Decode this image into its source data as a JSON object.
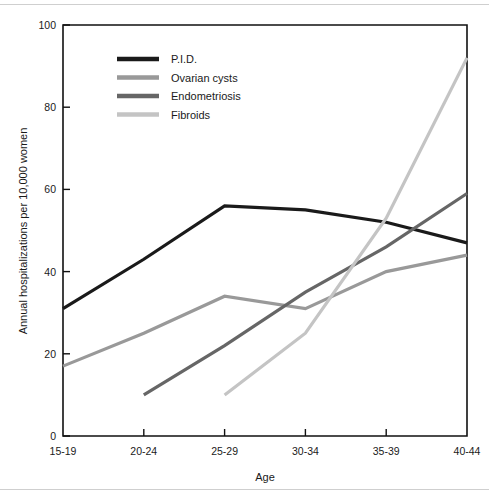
{
  "figure": {
    "background": "#ffffff",
    "rule_color": "#cfcfcf"
  },
  "chart_data": {
    "type": "line",
    "title": "",
    "subtitle": "",
    "xlabel": "Age",
    "ylabel": "Annual hospitalizations per 10,000 women",
    "categories": [
      "15-19",
      "20-24",
      "25-29",
      "30-34",
      "35-39",
      "40-44"
    ],
    "xticklabels": [
      "15-19",
      "20-24",
      "25-29",
      "30-34",
      "35-39",
      "40-44"
    ],
    "yticklabels": [
      "0",
      "20",
      "40",
      "60",
      "80",
      "100"
    ],
    "yticks": [
      0,
      20,
      40,
      60,
      80,
      100
    ],
    "ylim": [
      0,
      100
    ],
    "grid": false,
    "legend_position": "upper-left-inside",
    "series": [
      {
        "name": "P.I.D.",
        "color": "#1a1a1a",
        "width": 3.2,
        "values": [
          31,
          43,
          56,
          55,
          52,
          47
        ]
      },
      {
        "name": "Ovarian cysts",
        "color": "#999999",
        "width": 3.2,
        "values": [
          17,
          25,
          34,
          31,
          40,
          44
        ]
      },
      {
        "name": "Endometriosis",
        "color": "#666666",
        "width": 3.2,
        "values": [
          null,
          10,
          22,
          35,
          46,
          59
        ]
      },
      {
        "name": "Fibroids",
        "color": "#c4c4c4",
        "width": 3.2,
        "values": [
          null,
          null,
          10,
          25,
          53,
          92
        ]
      }
    ]
  },
  "legend": {
    "entries": [
      {
        "label": "P.I.D.",
        "color": "#1a1a1a"
      },
      {
        "label": "Ovarian cysts",
        "color": "#999999"
      },
      {
        "label": "Endometriosis",
        "color": "#666666"
      },
      {
        "label": "Fibroids",
        "color": "#c4c4c4"
      }
    ]
  }
}
